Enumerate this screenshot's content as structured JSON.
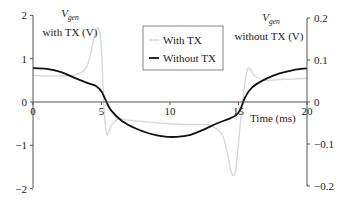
{
  "chart_data": {
    "type": "line",
    "title": "",
    "xlabel": "Time (ms)",
    "ylabel_left": {
      "main": "V",
      "sub": "gen",
      "rest": "with TX (V)"
    },
    "ylabel_right": {
      "main": "V",
      "sub": "gen",
      "rest": "without TX (V)"
    },
    "xlim": [
      0,
      20
    ],
    "ylim_left": [
      -2,
      2
    ],
    "ylim_right": [
      -0.2,
      0.2
    ],
    "x_ticks": [
      "0",
      "5",
      "10",
      "15",
      "20"
    ],
    "y_ticks_left": [
      "2",
      "1",
      "0",
      "−1",
      "−2"
    ],
    "y_ticks_right": [
      "0.2",
      "0.1",
      "0",
      "−0.1",
      "−0.2"
    ],
    "grid": false,
    "legend": {
      "position": "top-center",
      "entries": [
        "With TX",
        "Without TX"
      ]
    },
    "series": [
      {
        "name": "With TX",
        "axis": "left",
        "color": "#d8d8d8",
        "x": [
          0,
          1,
          2,
          3,
          3.8,
          4.2,
          4.5,
          4.8,
          5.0,
          5.2,
          5.4,
          5.7,
          6.2,
          7,
          8,
          9,
          10,
          11,
          12,
          13,
          13.8,
          14.2,
          14.5,
          14.8,
          15.1,
          15.4,
          15.7,
          16.2,
          17,
          18,
          19,
          20
        ],
        "values": [
          0.62,
          0.6,
          0.6,
          0.62,
          0.75,
          1.1,
          1.55,
          1.7,
          1.2,
          -0.2,
          -0.75,
          -0.55,
          -0.4,
          -0.42,
          -0.45,
          -0.48,
          -0.5,
          -0.52,
          -0.52,
          -0.55,
          -0.75,
          -1.2,
          -1.65,
          -1.55,
          -0.6,
          0.3,
          0.78,
          0.6,
          0.5,
          0.52,
          0.53,
          0.55
        ]
      },
      {
        "name": "Without TX",
        "axis": "right",
        "color": "#111111",
        "x": [
          0,
          1,
          2,
          3,
          4,
          4.6,
          5.0,
          5.3,
          5.7,
          6.5,
          7.5,
          8.5,
          9.5,
          10.5,
          11.5,
          12.5,
          13.5,
          14.3,
          14.8,
          15.1,
          15.5,
          16,
          17,
          18,
          19,
          20
        ],
        "values": [
          0.081,
          0.079,
          0.072,
          0.058,
          0.045,
          0.038,
          0.025,
          0.005,
          -0.02,
          -0.045,
          -0.063,
          -0.075,
          -0.082,
          -0.083,
          -0.078,
          -0.065,
          -0.05,
          -0.04,
          -0.032,
          -0.02,
          0.012,
          0.035,
          0.055,
          0.068,
          0.076,
          0.08
        ]
      }
    ]
  }
}
